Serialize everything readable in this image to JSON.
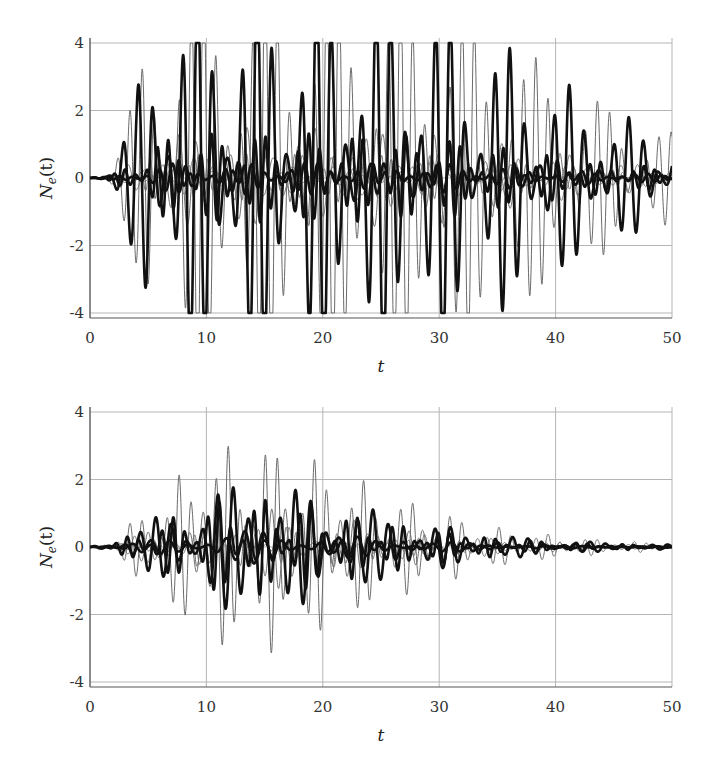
{
  "chart_data": [
    {
      "type": "line",
      "title": "",
      "xlabel": "t",
      "ylabel": "N_e(t)",
      "ylabel_main": "N",
      "ylabel_sub": "e",
      "ylabel_arg": "(t)",
      "xlim": [
        0,
        50
      ],
      "ylim": [
        -4.2,
        4.2
      ],
      "xticks": [
        0,
        10,
        20,
        30,
        40,
        50
      ],
      "xtick_labels": [
        "0",
        "10",
        "20",
        "30",
        "40",
        "50"
      ],
      "yticks": [
        -4,
        -2,
        0,
        2,
        4
      ],
      "ytick_labels": [
        "-4",
        "-2",
        "0",
        "2",
        "4"
      ],
      "grid": true,
      "legend": null,
      "clip_limits": [
        -4,
        4
      ],
      "description": "Many oscillating trajectories (thick black and thin gray lines); several saturate at +/-4 between t~5 and t~37, amplitude decays toward t=50",
      "envelope": {
        "t": [
          0,
          2,
          4,
          5,
          10,
          20,
          30,
          35,
          40,
          45,
          50
        ],
        "max_amplitude": [
          0,
          0.5,
          2.5,
          5,
          6,
          6,
          5.5,
          4.2,
          3.0,
          2.0,
          1.3
        ]
      },
      "series": [
        {
          "name": "thick-large",
          "style": "thick",
          "amp_scale": 1.0,
          "freq": 2.4
        },
        {
          "name": "thin-large",
          "style": "thin",
          "amp_scale": 1.05,
          "freq": 2.9
        },
        {
          "name": "thick-medium",
          "style": "thick",
          "amp_scale": 0.22,
          "freq": 3.3
        },
        {
          "name": "thin-medium",
          "style": "thin",
          "amp_scale": 0.25,
          "freq": 2.1
        },
        {
          "name": "thin-small-1",
          "style": "thin",
          "amp_scale": 0.12,
          "freq": 3.7
        },
        {
          "name": "thin-small-2",
          "style": "thin",
          "amp_scale": 0.1,
          "freq": 1.8
        },
        {
          "name": "thick-small",
          "style": "thick",
          "amp_scale": 0.08,
          "freq": 2.7
        }
      ]
    },
    {
      "type": "line",
      "title": "",
      "xlabel": "t",
      "ylabel": "N_e(t)",
      "ylabel_main": "N",
      "ylabel_sub": "e",
      "ylabel_arg": "(t)",
      "xlim": [
        0,
        50
      ],
      "ylim": [
        -4.2,
        4.2
      ],
      "xticks": [
        0,
        10,
        20,
        30,
        40,
        50
      ],
      "xtick_labels": [
        "0",
        "10",
        "20",
        "30",
        "40",
        "50"
      ],
      "yticks": [
        -4,
        -2,
        0,
        2,
        4
      ],
      "ytick_labels": [
        "-4",
        "-2",
        "0",
        "2",
        "4"
      ],
      "grid": true,
      "legend": null,
      "clip_limits": null,
      "description": "Many oscillating trajectories; peak amplitude ~3.2 near t~11 and -3.6 near t~14, decaying to ~0.1 by t=50",
      "envelope": {
        "t": [
          0,
          2,
          4,
          6,
          10,
          14,
          18,
          22,
          26,
          30,
          35,
          40,
          45,
          50
        ],
        "max_amplitude": [
          0,
          0.35,
          0.9,
          1.6,
          2.9,
          3.3,
          2.9,
          2.2,
          1.6,
          1.1,
          0.6,
          0.35,
          0.2,
          0.12
        ]
      },
      "series": [
        {
          "name": "thin-peak",
          "style": "thin",
          "amp_scale": 1.0,
          "freq": 2.9
        },
        {
          "name": "thick-large",
          "style": "thick",
          "amp_scale": 0.6,
          "freq": 2.3
        },
        {
          "name": "thick-medium",
          "style": "thick",
          "amp_scale": 0.45,
          "freq": 3.1
        },
        {
          "name": "thin-medium",
          "style": "thin",
          "amp_scale": 0.4,
          "freq": 2.6
        },
        {
          "name": "thin-small",
          "style": "thin",
          "amp_scale": 0.2,
          "freq": 3.5
        },
        {
          "name": "thick-small",
          "style": "thick",
          "amp_scale": 0.15,
          "freq": 1.9
        }
      ]
    }
  ],
  "colors": {
    "thick": "#111111",
    "thin": "#6a6a6a",
    "grid": "#b5b5b5",
    "axis": "#555555"
  }
}
